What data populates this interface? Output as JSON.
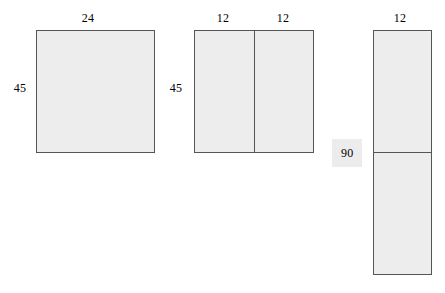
{
  "figure": {
    "kind": "geometry-diagram",
    "background_color": "#ffffff",
    "shape_fill_color": "#ededed",
    "shape_stroke_color": "#555555",
    "label_highlight_color": "#ececec"
  },
  "diagrams": [
    {
      "name": "square-24-by-45",
      "top_labels": [
        "24"
      ],
      "left_label": "45",
      "divisions": 1,
      "orientation": "none"
    },
    {
      "name": "rectangle-split-vertically",
      "top_labels": [
        "12",
        "12"
      ],
      "left_label": "45",
      "divisions": 2,
      "orientation": "vertical"
    },
    {
      "name": "tall-rectangle-split-horizontally",
      "top_labels": [
        "12"
      ],
      "left_label": "90",
      "divisions": 2,
      "orientation": "horizontal",
      "left_label_highlighted": true
    }
  ],
  "labels": {
    "fig1_top": "24",
    "fig1_left": "45",
    "fig2_top_a": "12",
    "fig2_top_b": "12",
    "fig2_left": "45",
    "fig3_top": "12",
    "fig3_left": "90"
  }
}
